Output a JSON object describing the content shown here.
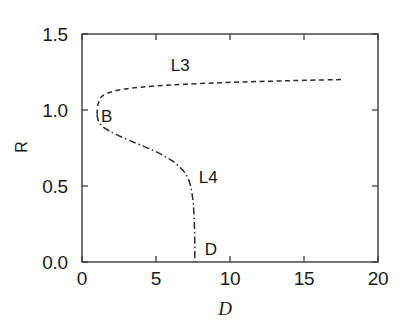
{
  "chart_data": {
    "type": "line",
    "title": "",
    "subtitle": "",
    "xlabel": "D",
    "xlabel_style": "script",
    "ylabel": "R",
    "xlim": [
      0,
      20
    ],
    "ylim": [
      0.0,
      1.5
    ],
    "grid": false,
    "legend": "none",
    "xticks": [
      "0",
      "5",
      "10",
      "15",
      "20"
    ],
    "xtick_values": [
      0,
      5,
      10,
      15,
      20
    ],
    "yticks": [
      "0.0",
      "0.5",
      "1.0",
      "1.5"
    ],
    "ytick_values": [
      0.0,
      0.5,
      1.0,
      1.5
    ],
    "tick_direction": "in",
    "series": [
      {
        "name": "L3",
        "style": "dashed",
        "color": "#2b2b2b",
        "points": [
          [
            1.02,
            0.97
          ],
          [
            1.05,
            1.02
          ],
          [
            1.15,
            1.06
          ],
          [
            1.35,
            1.09
          ],
          [
            1.7,
            1.11
          ],
          [
            2.2,
            1.125
          ],
          [
            3.0,
            1.14
          ],
          [
            4.0,
            1.15
          ],
          [
            5.5,
            1.162
          ],
          [
            7.0,
            1.17
          ],
          [
            9.0,
            1.178
          ],
          [
            11.0,
            1.185
          ],
          [
            13.0,
            1.19
          ],
          [
            15.0,
            1.195
          ],
          [
            17.5,
            1.2
          ]
        ]
      },
      {
        "name": "L4",
        "style": "dashdot",
        "color": "#2b2b2b",
        "points": [
          [
            1.02,
            0.97
          ],
          [
            1.1,
            0.93
          ],
          [
            1.35,
            0.895
          ],
          [
            1.8,
            0.865
          ],
          [
            2.4,
            0.835
          ],
          [
            3.2,
            0.8
          ],
          [
            4.0,
            0.768
          ],
          [
            4.8,
            0.735
          ],
          [
            5.5,
            0.7
          ],
          [
            6.1,
            0.665
          ],
          [
            6.6,
            0.625
          ],
          [
            7.0,
            0.58
          ],
          [
            7.28,
            0.52
          ],
          [
            7.45,
            0.44
          ],
          [
            7.55,
            0.34
          ],
          [
            7.6,
            0.22
          ],
          [
            7.62,
            0.1
          ],
          [
            7.62,
            0.0
          ]
        ]
      }
    ],
    "annotations": [
      {
        "text": "L3",
        "x": 6.6,
        "y": 1.285,
        "name": "curve-label-l3"
      },
      {
        "text": "B",
        "x": 1.9,
        "y": 0.945,
        "name": "curve-label-b"
      },
      {
        "text": "L4",
        "x": 8.5,
        "y": 0.545,
        "name": "curve-label-l4"
      },
      {
        "text": "D",
        "x": 8.9,
        "y": 0.075,
        "name": "curve-label-d"
      }
    ],
    "special_points": [
      {
        "label": "B",
        "description": "fold / turning point joining L3 and L4",
        "x": 1.02,
        "y": 0.97
      },
      {
        "label": "D",
        "description": "L4 branch terminus on the R = 0 axis",
        "x": 7.62,
        "y": 0.0
      }
    ],
    "axis_color": "#3a3a3a",
    "background": "#ffffff"
  }
}
